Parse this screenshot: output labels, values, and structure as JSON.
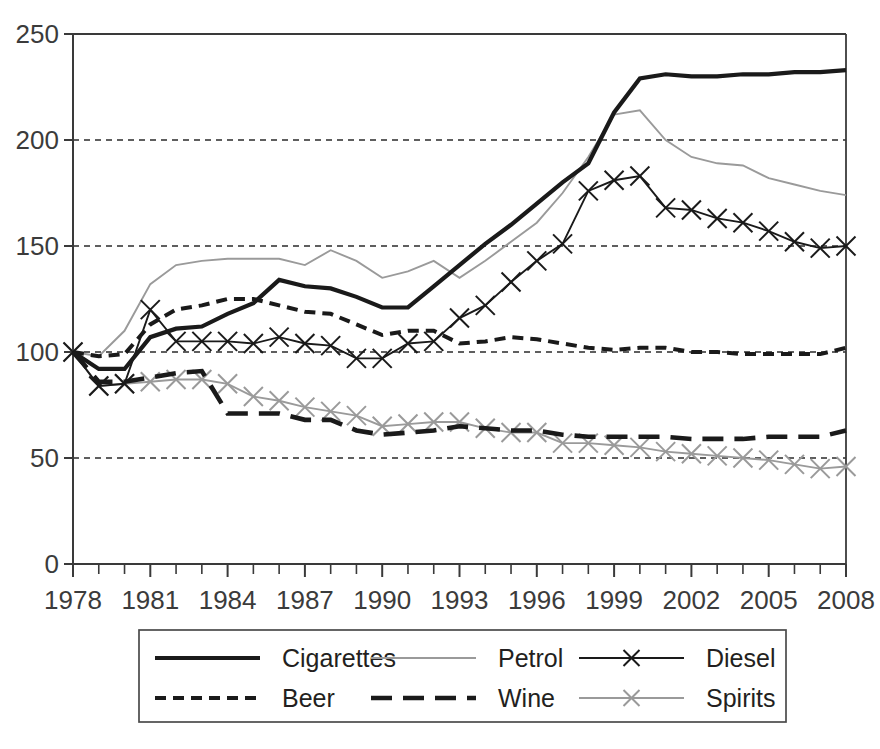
{
  "chart_data": {
    "type": "line",
    "title": "",
    "subtitle": "",
    "xlabel": "",
    "ylabel": "",
    "xlim": [
      1978,
      2008
    ],
    "ylim": [
      0,
      250
    ],
    "yticks": [
      0,
      50,
      100,
      150,
      200,
      250
    ],
    "xticks": [
      1978,
      1981,
      1984,
      1987,
      1990,
      1993,
      1996,
      1999,
      2002,
      2005,
      2008
    ],
    "xtick_labels": [
      "1978",
      "1981",
      "1984",
      "1987",
      "1990",
      "1993",
      "1996",
      "1999",
      "2002",
      "2005",
      "2008"
    ],
    "ytick_labels": [
      "0",
      "50",
      "100",
      "150",
      "200",
      "250"
    ],
    "x_minor_tick_interval": 1,
    "grid": "horizontal-dotted",
    "legend_position": "bottom",
    "x": [
      1978,
      1979,
      1980,
      1981,
      1982,
      1983,
      1984,
      1985,
      1986,
      1987,
      1988,
      1989,
      1990,
      1991,
      1992,
      1993,
      1994,
      1995,
      1996,
      1997,
      1998,
      1999,
      2000,
      2001,
      2002,
      2003,
      2004,
      2005,
      2006,
      2007,
      2008
    ],
    "series": [
      {
        "name": "Cigarettes",
        "style": "solid-thick",
        "color": "#1a1a1a",
        "marker": "none",
        "values": [
          100,
          92,
          92,
          107,
          111,
          112,
          118,
          123,
          134,
          131,
          130,
          126,
          121,
          121,
          131,
          141,
          151,
          160,
          170,
          180,
          189,
          213,
          229,
          231,
          230,
          230,
          231,
          231,
          232,
          232,
          233
        ]
      },
      {
        "name": "Petrol",
        "style": "solid-thin",
        "color": "#9a9a9a",
        "marker": "none",
        "values": [
          100,
          98,
          110,
          132,
          141,
          143,
          144,
          144,
          144,
          141,
          148,
          143,
          135,
          138,
          143,
          135,
          143,
          152,
          161,
          175,
          192,
          212,
          214,
          200,
          192,
          189,
          188,
          182,
          179,
          176,
          174
        ]
      },
      {
        "name": "Diesel",
        "style": "solid-thin-x",
        "color": "#1a1a1a",
        "marker": "x",
        "values": [
          100,
          84,
          85,
          120,
          105,
          105,
          105,
          104,
          107,
          104,
          103,
          97,
          97,
          104,
          105,
          116,
          122,
          133,
          143,
          151,
          176,
          181,
          183,
          168,
          167,
          163,
          161,
          157,
          152,
          149,
          150
        ]
      },
      {
        "name": "Beer",
        "style": "dashed-fine",
        "color": "#1a1a1a",
        "marker": "none",
        "values": [
          100,
          98,
          99,
          113,
          120,
          122,
          125,
          125,
          122,
          119,
          118,
          113,
          108,
          110,
          110,
          104,
          105,
          107,
          106,
          104,
          102,
          101,
          102,
          102,
          100,
          100,
          99,
          99,
          99,
          99,
          102
        ]
      },
      {
        "name": "Wine",
        "style": "dashed-coarse",
        "color": "#1a1a1a",
        "marker": "none",
        "values": [
          100,
          86,
          86,
          88,
          90,
          91,
          71,
          71,
          71,
          68,
          68,
          63,
          61,
          62,
          63,
          65,
          64,
          63,
          63,
          61,
          60,
          60,
          60,
          60,
          59,
          59,
          59,
          60,
          60,
          60,
          63
        ]
      },
      {
        "name": "Spirits",
        "style": "solid-thin-x",
        "color": "#9a9a9a",
        "marker": "x",
        "values": [
          100,
          84,
          85,
          86,
          87,
          87,
          85,
          79,
          77,
          74,
          72,
          70,
          65,
          66,
          67,
          67,
          64,
          62,
          62,
          57,
          57,
          56,
          55,
          53,
          52,
          51,
          50,
          49,
          47,
          45,
          46
        ]
      }
    ]
  },
  "legend": {
    "entries": [
      {
        "label": "Cigarettes",
        "style": "solid-thick",
        "color": "#1a1a1a",
        "marker": "none"
      },
      {
        "label": "Petrol",
        "style": "solid-thin",
        "color": "#9a9a9a",
        "marker": "none"
      },
      {
        "label": "Diesel",
        "style": "solid-thin-x",
        "color": "#1a1a1a",
        "marker": "x"
      },
      {
        "label": "Beer",
        "style": "dashed-fine",
        "color": "#1a1a1a",
        "marker": "none"
      },
      {
        "label": "Wine",
        "style": "dashed-coarse",
        "color": "#1a1a1a",
        "marker": "none"
      },
      {
        "label": "Spirits",
        "style": "solid-thin-x",
        "color": "#9a9a9a",
        "marker": "x"
      }
    ]
  },
  "page_bottom_fragment": {
    "text": ""
  }
}
